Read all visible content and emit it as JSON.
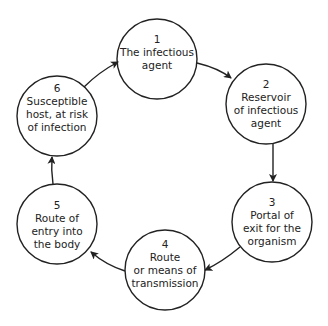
{
  "diagram": {
    "type": "cycle",
    "stroke_color": "#222222",
    "background": "#ffffff",
    "nodes": [
      {
        "id": "n1",
        "number": "1",
        "lines": [
          "The infectious",
          "agent"
        ],
        "cx": 157,
        "cy": 59,
        "r": 40
      },
      {
        "id": "n2",
        "number": "2",
        "lines": [
          "Reservoir",
          "of infectious",
          "agent"
        ],
        "cx": 266,
        "cy": 104,
        "r": 40
      },
      {
        "id": "n3",
        "number": "3",
        "lines": [
          "Portal of",
          "exit for the",
          "organism"
        ],
        "cx": 272,
        "cy": 222,
        "r": 40
      },
      {
        "id": "n4",
        "number": "4",
        "lines": [
          "Route",
          "or means of",
          "transmission"
        ],
        "cx": 165,
        "cy": 270,
        "r": 40
      },
      {
        "id": "n5",
        "number": "5",
        "lines": [
          "Route of",
          "entry into",
          "the body"
        ],
        "cx": 57,
        "cy": 224,
        "r": 40
      },
      {
        "id": "n6",
        "number": "6",
        "lines": [
          "Susceptible",
          "host, at risk",
          "of infection"
        ],
        "cx": 57,
        "cy": 116,
        "r": 40
      }
    ],
    "edges": [
      {
        "from": "1",
        "to": "2"
      },
      {
        "from": "2",
        "to": "3"
      },
      {
        "from": "3",
        "to": "4"
      },
      {
        "from": "4",
        "to": "5"
      },
      {
        "from": "5",
        "to": "6"
      },
      {
        "from": "6",
        "to": "1"
      }
    ]
  }
}
